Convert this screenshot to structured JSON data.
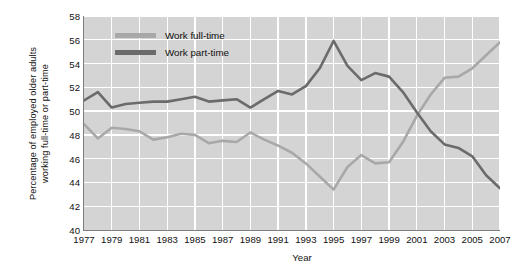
{
  "chart_data": {
    "type": "line",
    "title": "",
    "xlabel": "Year",
    "ylabel": "Percentage of employed older adults working full-time or part-time",
    "ylabel_lines": [
      "Percentage of employed older adults",
      "working full-time or part-time"
    ],
    "ylim": [
      40,
      58
    ],
    "xlim": [
      1977,
      2007
    ],
    "yticks": [
      40,
      42,
      44,
      46,
      48,
      50,
      52,
      54,
      56,
      58
    ],
    "xticks": [
      1977,
      1979,
      1981,
      1983,
      1985,
      1987,
      1989,
      1991,
      1993,
      1995,
      1997,
      1999,
      2001,
      2003,
      2005,
      2007
    ],
    "grid": true,
    "grid_color": "#ffffff",
    "plot_background": "#d4d4d4",
    "legend_position": "top-left-inside",
    "x": [
      1977,
      1978,
      1979,
      1980,
      1981,
      1982,
      1983,
      1984,
      1985,
      1986,
      1987,
      1988,
      1989,
      1990,
      1991,
      1992,
      1993,
      1994,
      1995,
      1996,
      1997,
      1998,
      1999,
      2000,
      2001,
      2002,
      2003,
      2004,
      2005,
      2006,
      2007
    ],
    "series": [
      {
        "name": "Work full-time",
        "color": "#a8a8a8",
        "values": [
          48.9,
          47.7,
          48.6,
          48.5,
          48.3,
          47.6,
          47.8,
          48.1,
          48.0,
          47.3,
          47.5,
          47.4,
          48.2,
          47.6,
          47.1,
          46.5,
          45.6,
          44.5,
          43.4,
          45.3,
          46.3,
          45.6,
          45.7,
          47.4,
          49.6,
          51.4,
          52.8,
          52.9,
          53.6,
          54.7,
          55.8
        ]
      },
      {
        "name": "Work part-time",
        "color": "#6b6b6b",
        "values": [
          50.9,
          51.6,
          50.3,
          50.6,
          50.7,
          50.8,
          50.8,
          51.0,
          51.2,
          50.8,
          50.9,
          51.0,
          50.3,
          51.0,
          51.7,
          51.4,
          52.1,
          53.6,
          55.9,
          53.8,
          52.6,
          53.2,
          52.9,
          51.6,
          49.9,
          48.3,
          47.2,
          46.9,
          46.2,
          44.6,
          43.5
        ]
      }
    ]
  },
  "legend": {
    "items": [
      {
        "label": "Work full-time",
        "color": "#a8a8a8"
      },
      {
        "label": "Work part-time",
        "color": "#6b6b6b"
      }
    ]
  }
}
